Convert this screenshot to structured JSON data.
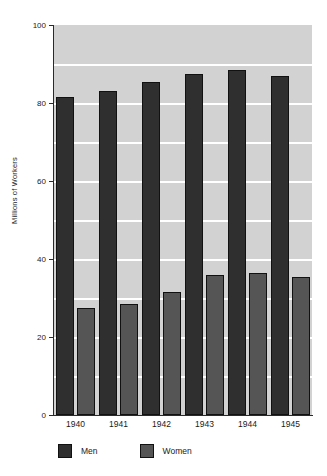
{
  "chart_data": {
    "type": "bar",
    "title": "",
    "xlabel": "",
    "ylabel": "Millions of Workers",
    "categories": [
      "1940",
      "1941",
      "1942",
      "1943",
      "1944",
      "1945"
    ],
    "series": [
      {
        "name": "Men",
        "color": "#2f2f2f",
        "values": [
          81.5,
          83.0,
          85.5,
          87.5,
          88.5,
          87.0
        ]
      },
      {
        "name": "Women",
        "color": "#555555",
        "values": [
          27.5,
          28.5,
          31.5,
          36.0,
          36.5,
          35.5
        ]
      }
    ],
    "ylim": [
      0,
      100
    ],
    "y_ticks": [
      0,
      20,
      40,
      60,
      80,
      100
    ],
    "y_tick_labels": [
      "0",
      "20",
      "40",
      "60",
      "80",
      "100"
    ],
    "gridlines": [
      10,
      20,
      30,
      40,
      50,
      60,
      70,
      80,
      90,
      100
    ],
    "grid": true,
    "grid_color": "#ffffff",
    "plot_background": "#d2d2d2",
    "legend": {
      "position": "bottom-left",
      "entries": [
        {
          "label": "Men",
          "color": "#2f2f2f"
        },
        {
          "label": "Women",
          "color": "#555555"
        }
      ]
    }
  }
}
